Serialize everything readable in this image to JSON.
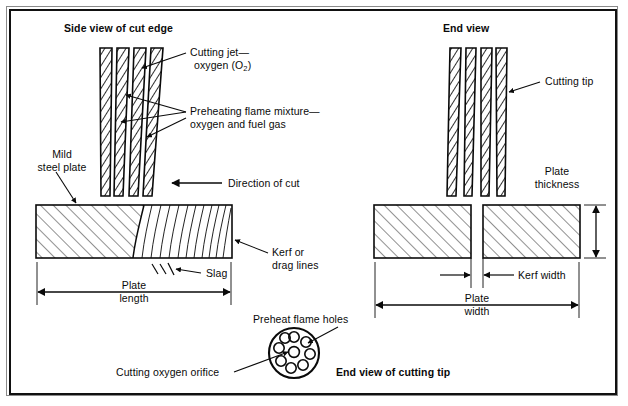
{
  "figure": {
    "background_color": "#ffffff",
    "ink_color": "#0a0a0a",
    "frame_color": "#111111"
  },
  "titles": {
    "side_view": "Side view of cut edge",
    "end_view": "End view",
    "tip_end_view": "End view of cutting tip"
  },
  "labels": {
    "cutting_jet_line1": "Cutting jet—",
    "cutting_jet_line2_pre": "oxygen (O",
    "cutting_jet_line2_sub": "2",
    "cutting_jet_line2_post": ")",
    "preheating_line1": "Preheating flame mixture—",
    "preheating_line2": "oxygen and fuel gas",
    "mild_steel_line1": "Mild",
    "mild_steel_line2": "steel plate",
    "direction_of_cut": "Direction of cut",
    "kerf_drag_line1": "Kerf or",
    "kerf_drag_line2": "drag lines",
    "slag": "Slag",
    "plate_length_line1": "Plate",
    "plate_length_line2": "length",
    "cutting_tip": "Cutting tip",
    "plate_thickness_line1": "Plate",
    "plate_thickness_line2": "thickness",
    "kerf_width": "Kerf width",
    "plate_width_line1": "Plate",
    "plate_width_line2": "width",
    "preheat_flame_holes": "Preheat flame holes",
    "cutting_oxygen_orifice": "Cutting oxygen orifice"
  },
  "diagram_parts": {
    "side_view_jets": 4,
    "end_view_jets": 4,
    "side_plate_hatch_style": "diagonal-45",
    "side_plate_drag_lines": 11,
    "end_plate_count": 2,
    "end_plate_hatch_style": "diagonal-45",
    "tip_preheat_holes": 8,
    "tip_center_holes": 1,
    "slag_tick_count": 3
  }
}
